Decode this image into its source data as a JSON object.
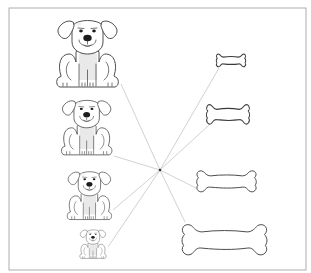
{
  "worksheet": {
    "description": "Matching worksheet: dogs of decreasing size paired with bones of increasing size via lines through a central point",
    "frame": {
      "x": 9,
      "y": 8,
      "width": 297,
      "height": 262,
      "color": "#9a9a9a"
    },
    "center_point": {
      "x": 160,
      "y": 170,
      "color": "#333333"
    },
    "line_color": "#bdbdbd",
    "dogs": [
      {
        "id": "dog-1",
        "size": "largest",
        "x": 55,
        "y": 14,
        "scale": 1.0,
        "anchor": {
          "x": 121,
          "y": 84
        }
      },
      {
        "id": "dog-2",
        "size": "large",
        "x": 60,
        "y": 95,
        "scale": 0.82,
        "anchor": {
          "x": 114,
          "y": 156
        }
      },
      {
        "id": "dog-3",
        "size": "medium",
        "x": 66,
        "y": 167,
        "scale": 0.72,
        "anchor": {
          "x": 113,
          "y": 210
        }
      },
      {
        "id": "dog-4",
        "size": "smallest",
        "x": 79,
        "y": 227,
        "scale": 0.43,
        "anchor": {
          "x": 108,
          "y": 247
        }
      }
    ],
    "bones": [
      {
        "id": "bone-1",
        "size": "smallest",
        "x": 216,
        "y": 53,
        "width": 30,
        "height": 15,
        "anchor": {
          "x": 219,
          "y": 68
        }
      },
      {
        "id": "bone-2",
        "size": "medium",
        "x": 206,
        "y": 103,
        "width": 44,
        "height": 23,
        "anchor": {
          "x": 209,
          "y": 125
        }
      },
      {
        "id": "bone-3",
        "size": "large",
        "x": 196,
        "y": 169,
        "width": 61,
        "height": 25,
        "anchor": {
          "x": 196,
          "y": 188
        }
      },
      {
        "id": "bone-4",
        "size": "largest",
        "x": 181,
        "y": 222,
        "width": 87,
        "height": 36,
        "anchor": {
          "x": 185,
          "y": 222
        }
      }
    ]
  }
}
